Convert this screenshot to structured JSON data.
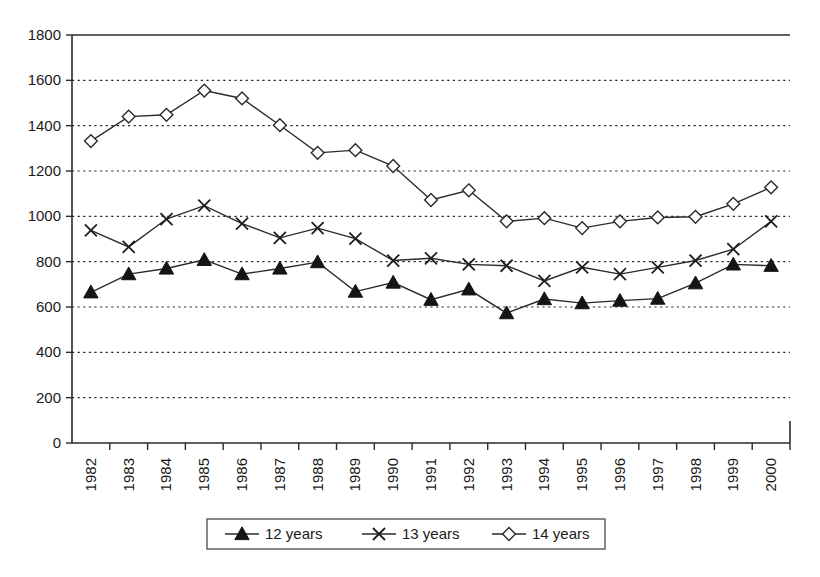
{
  "chart_data": {
    "type": "line",
    "title": "",
    "xlabel": "",
    "ylabel": "",
    "ylim": [
      0,
      1800
    ],
    "ytick_step": 200,
    "yticks": [
      "0",
      "200",
      "400",
      "600",
      "800",
      "1000",
      "1200",
      "1400",
      "1600",
      "1800"
    ],
    "grid": true,
    "legend_position": "bottom",
    "categories": [
      "1982",
      "1983",
      "1984",
      "1985",
      "1986",
      "1987",
      "1988",
      "1989",
      "1990",
      "1991",
      "1992",
      "1993",
      "1994",
      "1995",
      "1996",
      "1997",
      "1998",
      "1999",
      "2000"
    ],
    "series": [
      {
        "name": "12 years",
        "marker": "filled-triangle",
        "values": [
          665,
          745,
          770,
          808,
          745,
          770,
          798,
          668,
          708,
          632,
          678,
          573,
          635,
          617,
          628,
          637,
          705,
          788,
          782
        ]
      },
      {
        "name": "13 years",
        "marker": "x-cross",
        "values": [
          938,
          865,
          988,
          1047,
          968,
          905,
          948,
          902,
          805,
          815,
          788,
          782,
          715,
          775,
          745,
          775,
          805,
          855,
          978
        ]
      },
      {
        "name": "14 years",
        "marker": "open-diamond",
        "values": [
          1332,
          1440,
          1448,
          1555,
          1520,
          1402,
          1280,
          1292,
          1222,
          1072,
          1115,
          978,
          992,
          948,
          978,
          995,
          998,
          1055,
          1128
        ]
      }
    ]
  },
  "legend": {
    "items": [
      {
        "label": "12 years",
        "marker": "filled-triangle"
      },
      {
        "label": "13 years",
        "marker": "x-cross"
      },
      {
        "label": "14 years",
        "marker": "open-diamond"
      }
    ]
  },
  "colors": {
    "line": "#2b2b2b",
    "grid": "#2a2a2a",
    "axis": "#2a2a2a",
    "text": "#1a1a1a",
    "marker_fill_open": "#ffffff",
    "marker_fill_solid": "#151515",
    "background": "#ffffff"
  }
}
